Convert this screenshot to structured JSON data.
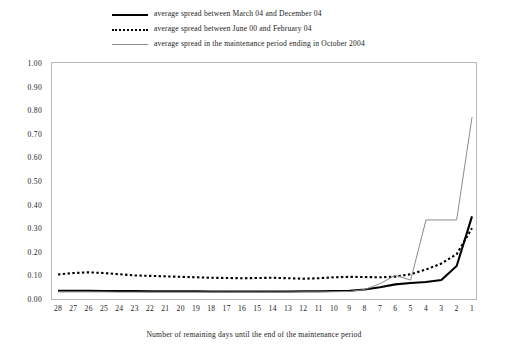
{
  "chart_data": {
    "type": "line",
    "title": "",
    "xlabel": "Number of remaining days until the end of the maintenance period",
    "ylabel": "",
    "xlim": [
      28,
      1
    ],
    "ylim": [
      0.0,
      1.0
    ],
    "x_reversed": true,
    "grid": false,
    "legend_position": "top-center",
    "x": [
      28,
      27,
      26,
      25,
      24,
      23,
      22,
      21,
      20,
      19,
      18,
      17,
      16,
      15,
      14,
      13,
      12,
      11,
      10,
      9,
      8,
      7,
      6,
      5,
      4,
      3,
      2,
      1
    ],
    "categories": [
      "28",
      "27",
      "26",
      "25",
      "24",
      "23",
      "22",
      "21",
      "20",
      "19",
      "18",
      "17",
      "16",
      "15",
      "14",
      "13",
      "12",
      "11",
      "10",
      "9",
      "8",
      "7",
      "6",
      "5",
      "4",
      "3",
      "2",
      "1"
    ],
    "ytick_labels": [
      "0.00",
      "0.10",
      "0.20",
      "0.30",
      "0.40",
      "0.50",
      "0.60",
      "0.70",
      "0.80",
      "0.90",
      "1.00"
    ],
    "ytick_values": [
      0.0,
      0.1,
      0.2,
      0.3,
      0.4,
      0.5,
      0.6,
      0.7,
      0.8,
      0.9,
      1.0
    ],
    "series": [
      {
        "name": "average spread between March 04 and December 04",
        "style": "solid",
        "color": "#000000",
        "width": 2.1,
        "values": [
          0.035,
          0.035,
          0.035,
          0.034,
          0.034,
          0.034,
          0.033,
          0.033,
          0.033,
          0.033,
          0.032,
          0.032,
          0.032,
          0.032,
          0.032,
          0.032,
          0.033,
          0.033,
          0.034,
          0.035,
          0.04,
          0.05,
          0.062,
          0.068,
          0.072,
          0.08,
          0.14,
          0.35
        ]
      },
      {
        "name": "average spread between June 00 and February 04",
        "style": "dotted",
        "color": "#000000",
        "width": 2.1,
        "values": [
          0.104,
          0.11,
          0.113,
          0.11,
          0.105,
          0.1,
          0.098,
          0.096,
          0.094,
          0.092,
          0.09,
          0.089,
          0.088,
          0.089,
          0.09,
          0.088,
          0.086,
          0.088,
          0.092,
          0.094,
          0.093,
          0.092,
          0.095,
          0.105,
          0.125,
          0.15,
          0.19,
          0.3
        ]
      },
      {
        "name": "average spread in the maintenance period ending in October 2004",
        "style": "solid",
        "color": "#8a8a8a",
        "width": 1.0,
        "values": [
          0.03,
          0.03,
          0.03,
          0.03,
          0.029,
          0.029,
          0.029,
          0.029,
          0.029,
          0.029,
          0.029,
          0.029,
          0.029,
          0.029,
          0.029,
          0.029,
          0.03,
          0.03,
          0.031,
          0.032,
          0.04,
          0.065,
          0.1,
          0.08,
          0.335,
          0.335,
          0.335,
          0.77
        ]
      }
    ]
  },
  "legend": {
    "items": [
      {
        "label": "average spread between March 04 and December 04",
        "swatch": "solid-black"
      },
      {
        "label": "average spread between June 00 and February 04",
        "swatch": "dotted-black"
      },
      {
        "label": "average spread in the maintenance period ending in October 2004",
        "swatch": "solid-gray"
      }
    ]
  },
  "axis": {
    "x_title": "Number of remaining days until the end of the maintenance period"
  }
}
